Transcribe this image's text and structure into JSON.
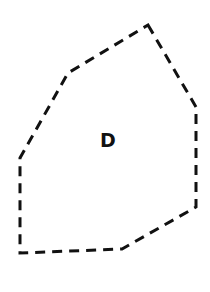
{
  "diagram": {
    "shape": {
      "type": "polygon",
      "style": "dashed",
      "stroke_color": "#111111",
      "fill": "none",
      "vertices": [
        [
          148,
          25
        ],
        [
          196,
          107
        ],
        [
          196,
          207
        ],
        [
          122,
          249
        ],
        [
          20,
          253
        ],
        [
          20,
          158
        ],
        [
          68,
          73
        ]
      ]
    },
    "label": {
      "text": "D",
      "x": 108,
      "y": 147
    }
  }
}
